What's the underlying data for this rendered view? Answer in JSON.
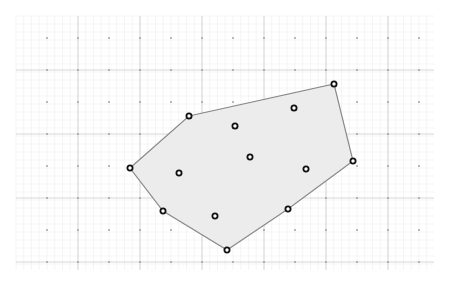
{
  "diagram": {
    "type": "convex-hull",
    "canvas": {
      "width": 462,
      "height": 289,
      "background": "#ffffff"
    },
    "grid": {
      "x_start": 16,
      "x_end": 434,
      "y_start": 16,
      "y_end": 270,
      "minor_spacing_x": 7.75,
      "minor_spacing_y": 8,
      "major_lines_x": [
        78,
        140,
        202,
        264,
        326,
        388
      ],
      "major_lines_y": [
        70,
        134,
        198,
        262
      ],
      "dot_cols": [
        47,
        78,
        109,
        140,
        171,
        202,
        233,
        264,
        295,
        326,
        357,
        388,
        419
      ],
      "dot_rows": [
        38,
        70,
        102,
        134,
        166,
        198,
        230,
        262
      ],
      "minor_color": "#efefef",
      "major_color": "#d2d2d2",
      "dot_color": "#9a9a9a"
    },
    "hull": {
      "fill": "#ececec",
      "stroke": "#8a8a8a",
      "vertices": [
        {
          "x": 130,
          "y": 168
        },
        {
          "x": 189,
          "y": 116
        },
        {
          "x": 334,
          "y": 84
        },
        {
          "x": 353,
          "y": 161
        },
        {
          "x": 288,
          "y": 209
        },
        {
          "x": 227,
          "y": 250
        },
        {
          "x": 163,
          "y": 211
        }
      ]
    },
    "interior_points": [
      {
        "x": 294,
        "y": 108
      },
      {
        "x": 235,
        "y": 126
      },
      {
        "x": 250,
        "y": 157
      },
      {
        "x": 179,
        "y": 173
      },
      {
        "x": 306,
        "y": 169
      },
      {
        "x": 215,
        "y": 216
      }
    ],
    "point_style": {
      "radius": 2.6,
      "stroke": "#111111",
      "fill": "#ffffff",
      "stroke_width": 1.8
    }
  }
}
